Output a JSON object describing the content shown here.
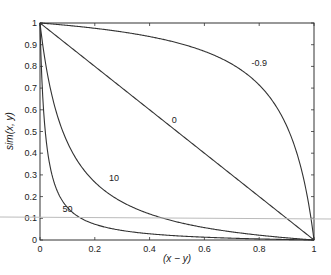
{
  "chart_data": {
    "type": "line",
    "title": "",
    "xlabel": "(x - y)",
    "ylabel": "sim(x, y)",
    "xlim": [
      0,
      1
    ],
    "ylim": [
      0,
      1
    ],
    "grid": false,
    "legend": "none (inline curve labels)",
    "x_ticks": [
      "0",
      "0.2",
      "0.4",
      "0.6",
      "0.8",
      "1"
    ],
    "y_ticks": [
      "0",
      "0.1",
      "0.2",
      "0.3",
      "0.4",
      "0.5",
      "0.6",
      "0.7",
      "0.8",
      "0.9",
      "1"
    ],
    "x": [
      0,
      0.1,
      0.2,
      0.3,
      0.4,
      0.5,
      0.6,
      0.7,
      0.8,
      0.9,
      1.0
    ],
    "series": [
      {
        "name": "-0.9",
        "values": [
          1.0,
          0.989,
          0.976,
          0.959,
          0.938,
          0.909,
          0.87,
          0.811,
          0.714,
          0.526,
          0.0
        ]
      },
      {
        "name": "0",
        "values": [
          1.0,
          0.9,
          0.8,
          0.7,
          0.6,
          0.5,
          0.4,
          0.3,
          0.2,
          0.1,
          0.0
        ]
      },
      {
        "name": "10",
        "values": [
          1.0,
          0.45,
          0.267,
          0.175,
          0.12,
          0.083,
          0.057,
          0.0375,
          0.022,
          0.01,
          0.0
        ]
      },
      {
        "name": "50",
        "values": [
          1.0,
          0.15,
          0.073,
          0.0438,
          0.0286,
          0.0196,
          0.0129,
          0.0083,
          0.0049,
          0.0022,
          0.0
        ]
      }
    ],
    "curve_labels": [
      {
        "text": "-0.9",
        "x": 0.8,
        "y": 0.8
      },
      {
        "text": "0",
        "x": 0.49,
        "y": 0.54
      },
      {
        "text": "10",
        "x": 0.27,
        "y": 0.27
      },
      {
        "text": "50",
        "x": 0.1,
        "y": 0.13
      }
    ]
  },
  "labels": {
    "xlabel": "(x − y)",
    "ylabel": "sim(x, y)"
  }
}
